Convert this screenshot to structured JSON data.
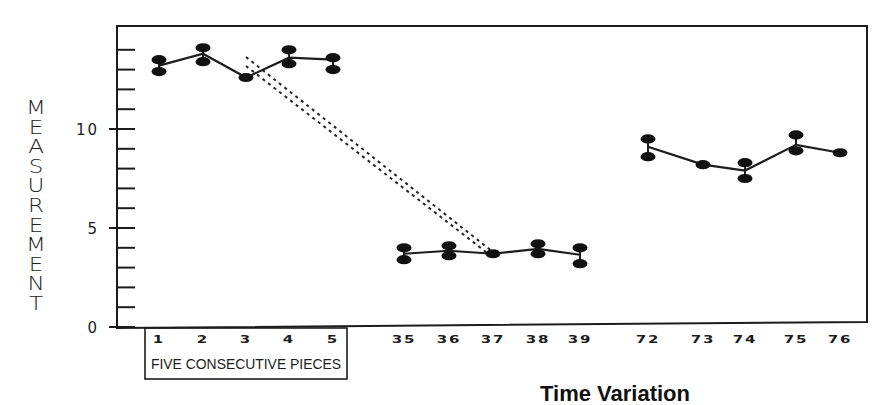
{
  "chart_data": {
    "type": "line",
    "title": "",
    "ylabel": "MEASUREMENT",
    "xlabel": "",
    "ylim": [
      0,
      15
    ],
    "yticks": [
      0,
      5,
      10
    ],
    "minor_ytick_step": 1,
    "grid": false,
    "legend": null,
    "x_groups": [
      {
        "name": "group-1",
        "label": "FIVE CONSECUTIVE PIECES",
        "categories": [
          "1",
          "2",
          "3",
          "4",
          "5"
        ],
        "high": [
          13.5,
          14.1,
          12.6,
          14.0,
          13.6
        ],
        "low": [
          12.9,
          13.4,
          12.6,
          13.3,
          13.0
        ],
        "mean": [
          13.2,
          13.8,
          12.6,
          13.6,
          13.5
        ]
      },
      {
        "name": "group-2",
        "label": "",
        "categories": [
          "35",
          "36",
          "37",
          "38",
          "39"
        ],
        "high": [
          4.0,
          4.1,
          3.7,
          4.2,
          4.0
        ],
        "low": [
          3.4,
          3.6,
          3.7,
          3.7,
          3.2
        ],
        "mean": [
          3.7,
          3.85,
          3.7,
          3.95,
          3.65
        ]
      },
      {
        "name": "group-3",
        "label": "",
        "categories": [
          "72",
          "73",
          "74",
          "75",
          "76"
        ],
        "high": [
          9.5,
          8.2,
          8.3,
          9.7,
          8.8
        ],
        "low": [
          8.6,
          8.2,
          7.5,
          8.9,
          8.8
        ],
        "mean": [
          9.1,
          8.2,
          7.9,
          9.2,
          8.8
        ]
      }
    ],
    "annotations": [
      {
        "type": "dashed-band",
        "from_category": "3",
        "to_category": "37",
        "description": "two parallel dashed lines connecting piece 3 to piece 37"
      }
    ]
  },
  "axis": {
    "y_tick_labels": [
      "0",
      "5",
      "10"
    ],
    "y_title_letters": [
      "M",
      "E",
      "A",
      "S",
      "U",
      "R",
      "E",
      "M",
      "E",
      "N",
      "T"
    ]
  },
  "caption_partial": "Time Variation"
}
